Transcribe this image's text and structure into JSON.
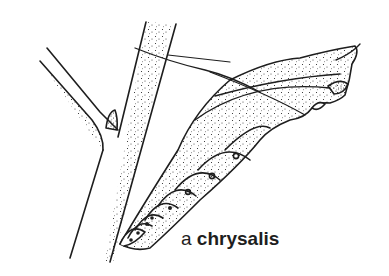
{
  "figure": {
    "caption": {
      "article": "a",
      "term": "chrysalis"
    },
    "colors": {
      "ink": "#1e1e1e",
      "background": "#ffffff"
    },
    "parts": [
      {
        "name": "main-branch"
      },
      {
        "name": "side-branch"
      },
      {
        "name": "bud"
      },
      {
        "name": "silk-girdle-thread"
      },
      {
        "name": "wing-case"
      },
      {
        "name": "abdominal-segments",
        "count": 7
      },
      {
        "name": "head-and-thorax"
      }
    ]
  }
}
